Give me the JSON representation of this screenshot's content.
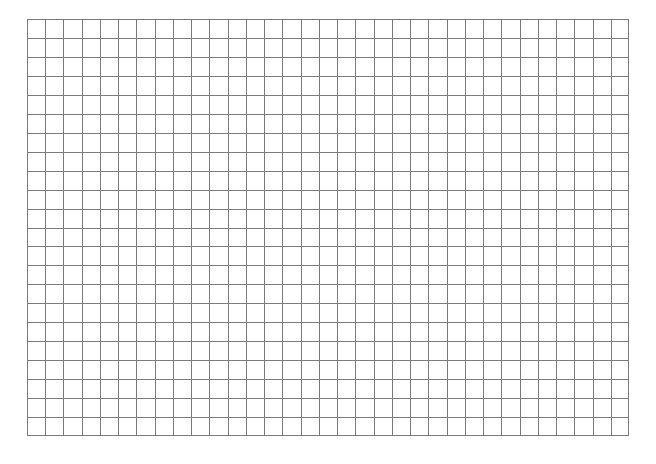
{
  "page": {
    "background": "#ffffff"
  },
  "grid": {
    "label": "Blank grid paper",
    "columns": 33,
    "rows": 22,
    "line_color": "#7a7a7a",
    "origin": {
      "x": 27,
      "y": 19
    },
    "size": {
      "width": 602,
      "height": 417
    }
  }
}
